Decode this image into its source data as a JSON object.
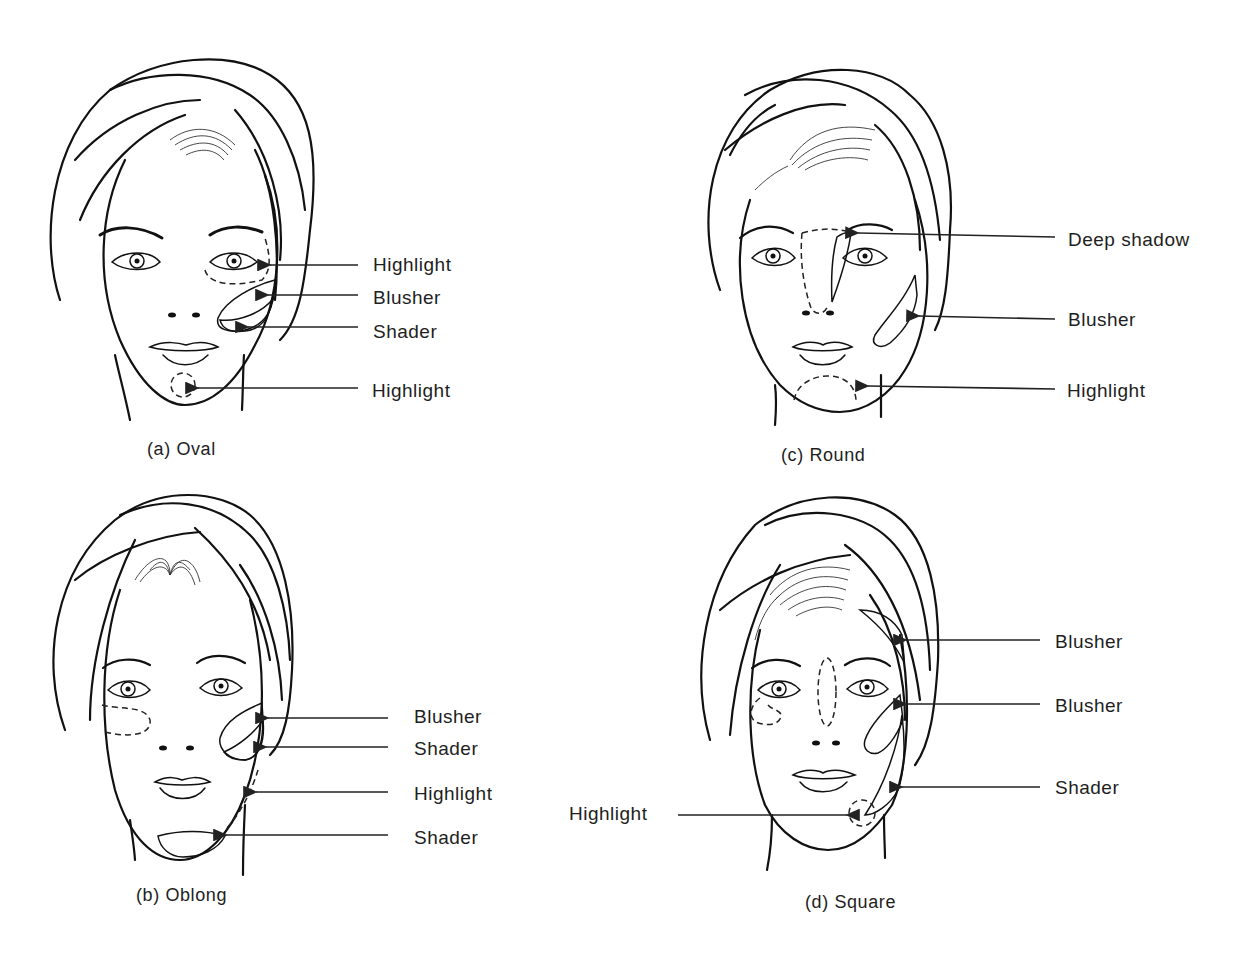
{
  "figure": {
    "background": "#ffffff",
    "ink_color": "#1e1e1e",
    "panels": [
      {
        "id": "a",
        "caption": "(a)  Oval",
        "face_shape": "Oval",
        "callouts": [
          {
            "label": "Highlight",
            "target": "under-eye area (dashed)"
          },
          {
            "label": "Blusher",
            "target": "upper cheekbone (dotted)"
          },
          {
            "label": "Shader",
            "target": "lower cheek (fine stipple)"
          },
          {
            "label": "Highlight",
            "target": "chin (dashed circle)"
          }
        ]
      },
      {
        "id": "b",
        "caption": "(b)  Oblong",
        "face_shape": "Oblong",
        "callouts": [
          {
            "label": "Blusher",
            "target": "upper cheek (dotted)"
          },
          {
            "label": "Shader",
            "target": "lower cheek (fine stipple)"
          },
          {
            "label": "Highlight",
            "target": "jawline (dashed)"
          },
          {
            "label": "Shader",
            "target": "chin tip (fine stipple)"
          }
        ]
      },
      {
        "id": "c",
        "caption": "(c)  Round",
        "face_shape": "Round",
        "callouts": [
          {
            "label": "Deep shadow",
            "target": "side of nose bridge"
          },
          {
            "label": "Blusher",
            "target": "cheek diagonal (dotted)"
          },
          {
            "label": "Highlight",
            "target": "chin (dashed)"
          }
        ]
      },
      {
        "id": "d",
        "caption": "(d)  Square",
        "face_shape": "Square",
        "callouts": [
          {
            "label": "Blusher",
            "target": "temple (dotted)"
          },
          {
            "label": "Blusher",
            "target": "cheek (dotted)"
          },
          {
            "label": "Shader",
            "target": "jaw corner (fine stipple)"
          },
          {
            "label": "Highlight",
            "target": "chin (dashed circle)"
          }
        ]
      }
    ]
  }
}
